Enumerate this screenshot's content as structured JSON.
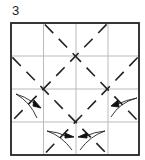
{
  "diagram": {
    "step_number": "3",
    "type": "origami-fold-diagram",
    "grid": {
      "rows": 4,
      "cols": 4,
      "line_color": "#bbbbbb"
    },
    "border_color": "#222222",
    "fold_lines": {
      "style": "valley-fold-dashed",
      "color": "#222222",
      "lines": [
        {
          "from": [
            1,
            0
          ],
          "to": [
            4,
            3
          ]
        },
        {
          "from": [
            3,
            0
          ],
          "to": [
            0,
            3
          ]
        },
        {
          "from": [
            0,
            1
          ],
          "to": [
            3,
            4
          ]
        },
        {
          "from": [
            4,
            1
          ],
          "to": [
            1,
            4
          ]
        }
      ]
    },
    "arrows": [
      {
        "name": "fold-arrow-left",
        "cell": [
          0,
          2
        ],
        "direction": "down-right"
      },
      {
        "name": "fold-arrow-right",
        "cell": [
          3,
          2
        ],
        "direction": "up-left"
      },
      {
        "name": "fold-arrow-bottom-left",
        "cell": [
          1,
          3
        ],
        "direction": "right"
      },
      {
        "name": "fold-arrow-bottom-right",
        "cell": [
          2,
          3
        ],
        "direction": "left"
      }
    ]
  }
}
